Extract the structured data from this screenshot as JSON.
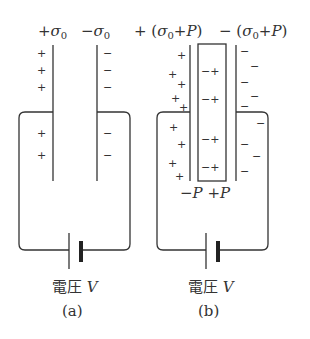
{
  "figure_a": {
    "label_plus": "+σ₀",
    "label_minus": "−σ₀",
    "voltage_label": "電圧 V",
    "caption": "(a)",
    "left_plate_signs": [
      "+",
      "+",
      "+",
      "+",
      "+"
    ],
    "right_plate_signs": [
      "−",
      "−",
      "−",
      "−",
      "−"
    ]
  },
  "figure_b": {
    "label_plus": "+(σ₀+P)",
    "label_minus": "−(σ₀+P)",
    "dielectric_surface_label": "−P +P",
    "voltage_label": "電圧 V",
    "caption": "(b)",
    "dielectric_pair": "−+",
    "dielectric_pair_count": 5
  },
  "colors": {
    "line": "#333333",
    "background": "#ffffff"
  }
}
